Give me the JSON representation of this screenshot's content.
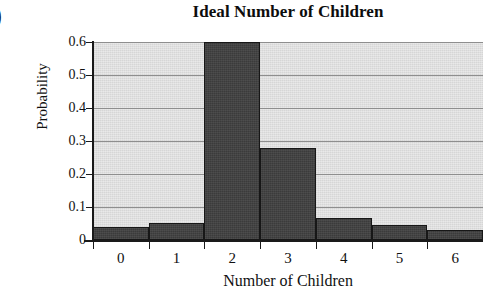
{
  "figure": {
    "stray_marker": ")"
  },
  "chart_data": {
    "type": "bar",
    "title": "Ideal Number of Children",
    "xlabel": "Number of Children",
    "ylabel": "Probability",
    "categories": [
      "0",
      "1",
      "2",
      "3",
      "4",
      "5",
      "6"
    ],
    "values": [
      0.04,
      0.053,
      0.6,
      0.278,
      0.068,
      0.046,
      0.03
    ],
    "ylim": [
      0,
      0.6
    ],
    "xlim": [
      -0.5,
      6.5
    ],
    "yticks": [
      "0",
      "0.1",
      "0.2",
      "0.3",
      "0.4",
      "0.5",
      "0.6"
    ],
    "ytick_values": [
      0,
      0.1,
      0.2,
      0.3,
      0.4,
      0.5,
      0.6
    ],
    "grid": "horizontal",
    "legend": "none",
    "bar_color": "#3b3b3b",
    "bar_edge_color": "#171717",
    "plot_background_color": "#d6d6d6",
    "gridline_color": "#8e8e8e",
    "axis_color": "#1a1a1a"
  }
}
